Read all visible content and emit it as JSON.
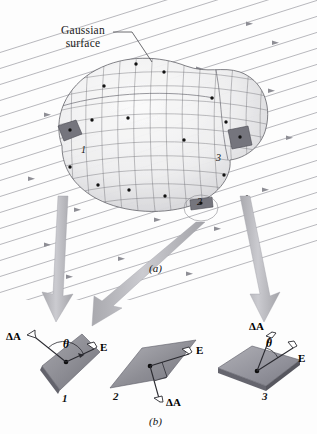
{
  "figure": {
    "captions": {
      "part_a": "(a)",
      "part_b": "(b)"
    }
  },
  "part_a": {
    "annotation": {
      "line1": "Gaussian",
      "line2": "surface"
    },
    "patch_numbers": [
      {
        "id": "1",
        "label": "1"
      },
      {
        "id": "2",
        "label": "2"
      },
      {
        "id": "3",
        "label": "3"
      }
    ],
    "field_direction": "up-and-to-the-right"
  },
  "part_b": {
    "panels": [
      {
        "number": "1",
        "area_vector_label": "ΔA",
        "field_vector_label": "E",
        "angle_label": "θ",
        "angle_description": "obtuse angle between ΔA and E"
      },
      {
        "number": "2",
        "area_vector_label": "ΔA",
        "field_vector_label": "E",
        "angle_label": "",
        "angle_description": "right angle between ΔA and E"
      },
      {
        "number": "3",
        "area_vector_label": "ΔA",
        "field_vector_label": "E",
        "angle_label": "θ",
        "angle_description": "acute angle between ΔA and E"
      }
    ]
  },
  "colors": {
    "field_line": "#9a9aa0",
    "callout_arrow": "#b8b8bc",
    "patch_fill_dark": "#7e7e84",
    "patch_fill_light": "#b9b9bf",
    "surface_mesh": "#6e6e74",
    "text": "#151515"
  }
}
